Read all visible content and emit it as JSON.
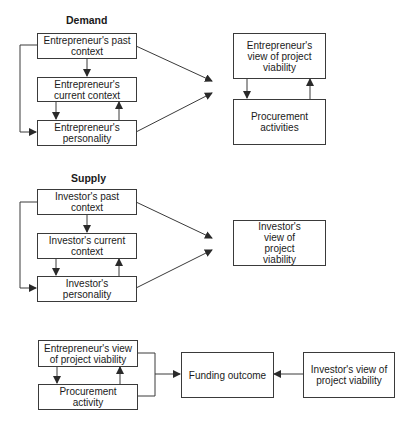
{
  "demand": {
    "title": "Demand",
    "past_context": "Entrepreneur's past context",
    "current_context": "Entrepreneur's current context",
    "personality": "Entrepreneur's personality",
    "view": "Entrepreneur's view of project viability",
    "procurement": "Procurement activities"
  },
  "supply": {
    "title": "Supply",
    "past_context": "Investor's past context",
    "current_context": "Investor's current context",
    "personality": "Investor's personality",
    "view": "Investor's view of project viability"
  },
  "outcome": {
    "entrepreneur_view": "Entrepreneur's view of project viability",
    "procurement": "Procurement activity",
    "funding": "Funding outcome",
    "investor_view": "Investor's view of project viability"
  },
  "colors": {
    "line": "#3a3a3a",
    "text": "#1a1a1a",
    "background": "#ffffff"
  }
}
